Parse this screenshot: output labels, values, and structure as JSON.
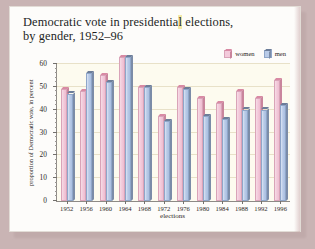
{
  "title": {
    "line1_a": "Democratic vote in presidentia",
    "line1_hl": "l",
    "line1_b": " elections,",
    "line2": "by gender, 1952–96"
  },
  "legend": {
    "items": [
      {
        "label": "women",
        "color": "#f3cadb",
        "icon": "cube-icon"
      },
      {
        "label": "men",
        "color": "#b9cbe8",
        "icon": "cube-icon"
      }
    ]
  },
  "chart_data": {
    "type": "bar",
    "title": "Democratic vote in presidential elections, by gender, 1952–96",
    "xlabel": "elections",
    "ylabel": "proportion of Democratic vote, in percent",
    "categories": [
      "1952",
      "1956",
      "1960",
      "1964",
      "1968",
      "1972",
      "1976",
      "1980",
      "1984",
      "1988",
      "1992",
      "1996"
    ],
    "series": [
      {
        "name": "women",
        "values": [
          50,
          49,
          56,
          64,
          51,
          38,
          51,
          46,
          44,
          49,
          46,
          54
        ]
      },
      {
        "name": "men",
        "values": [
          48,
          57,
          53,
          64,
          51,
          36,
          50,
          38,
          37,
          41,
          41,
          43
        ]
      }
    ],
    "ylim": [
      0,
      60
    ],
    "yticks": [
      0,
      10,
      20,
      30,
      40,
      50,
      60
    ],
    "grid": true,
    "legend_position": "top-right"
  }
}
